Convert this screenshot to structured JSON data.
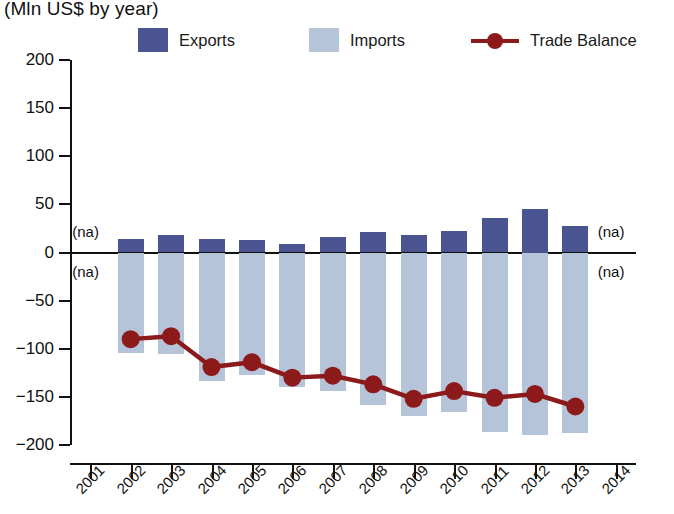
{
  "header": {
    "title_partial": "xports and Imports, by year",
    "subtitle": "(Mln US$ by year)"
  },
  "legend": {
    "position": "top",
    "items": [
      {
        "label": "Exports",
        "marker": "square-swatch",
        "color": "#4a5490"
      },
      {
        "label": "Imports",
        "marker": "square-swatch",
        "color": "#b6c4da"
      },
      {
        "label": "Trade Balance",
        "marker": "line-with-dot",
        "color": "#8c1a1a"
      }
    ]
  },
  "colors": {
    "exports": "#4a5490",
    "imports": "#b6c4da",
    "trade_balance": "#8c1a1a",
    "axis": "#111111",
    "background": "#ffffff"
  },
  "annotations": {
    "na_label": "(na)",
    "na_positions": [
      "2001-above-zero",
      "2001-below-zero",
      "2014-above-zero",
      "2014-below-zero"
    ]
  },
  "chart_data": {
    "type": "bar",
    "title": "xports and Imports, by year",
    "subtitle": "(Mln US$ by year)",
    "xlabel": "",
    "ylabel": "Mln US$",
    "ylim": [
      -200,
      200
    ],
    "ytick_values": [
      200,
      150,
      100,
      50,
      0,
      -50,
      -100,
      -150,
      -200
    ],
    "ytick_labels": [
      "200",
      "150",
      "100",
      "50",
      "0",
      "−50",
      "−100",
      "−150",
      "−200"
    ],
    "grid": false,
    "legend_position": "top",
    "x_axis_ticks": [
      "2001",
      "2002",
      "2003",
      "2004",
      "2005",
      "2006",
      "2007",
      "2008",
      "2009",
      "2010",
      "2011",
      "2012",
      "2013",
      "2014"
    ],
    "categories": [
      "2001",
      "2002",
      "2003",
      "2004",
      "2005",
      "2006",
      "2007",
      "2008",
      "2009",
      "2010",
      "2011",
      "2012",
      "2013",
      "2014"
    ],
    "series": [
      {
        "name": "Exports",
        "type": "bar",
        "color": "#4a5490",
        "values": [
          null,
          14,
          18,
          14,
          13,
          9,
          16,
          21,
          18,
          22,
          36,
          45,
          28,
          null
        ]
      },
      {
        "name": "Imports",
        "type": "bar",
        "color": "#b6c4da",
        "note": "plotted as negative magnitudes below zero",
        "values": [
          null,
          -104,
          -105,
          -133,
          -127,
          -140,
          -144,
          -158,
          -170,
          -166,
          -187,
          -190,
          -188,
          null
        ]
      },
      {
        "name": "Trade Balance",
        "type": "line",
        "color": "#8c1a1a",
        "values": [
          null,
          -90,
          -87,
          -119,
          -114,
          -130,
          -128,
          -137,
          -152,
          -144,
          -151,
          -147,
          -160,
          null
        ]
      }
    ]
  }
}
